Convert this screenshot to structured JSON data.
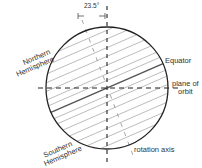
{
  "diagram": {
    "tilt_label": "23.5°",
    "labels": {
      "northern": [
        "Northern",
        "Hemisphere"
      ],
      "southern": [
        "Southern",
        "Hemisphere"
      ],
      "equator": "Equator",
      "plane_of_orbit": [
        "plane of",
        "orbit"
      ],
      "rotation_axis": "rotation axis"
    },
    "geometry": {
      "center": [
        107,
        88
      ],
      "radius": 61,
      "tilt_degrees": 23.5
    },
    "colors": {
      "outline": "#222222",
      "hatch": "#999999",
      "axis_dash": "#222222",
      "rotation_axis": "#777777",
      "text": "#333333"
    }
  }
}
